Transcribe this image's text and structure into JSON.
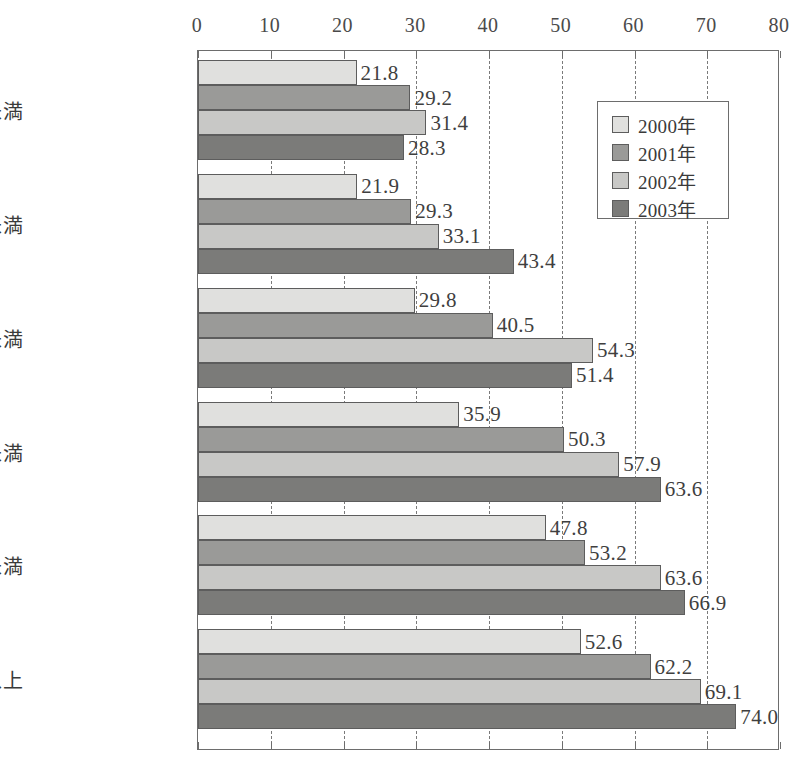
{
  "chart_data": {
    "type": "bar",
    "orientation": "horizontal",
    "title": "",
    "xlabel": "",
    "ylabel": "",
    "xlim": [
      0,
      80
    ],
    "xticks": [
      0,
      10,
      20,
      30,
      40,
      50,
      60,
      70,
      80
    ],
    "grid": true,
    "legend_position": "upper right",
    "categories": [
      "200万未満",
      "200〜400万未満",
      "400〜600万未満",
      "600〜800万未満",
      "800〜1000万未満",
      "1000万以上"
    ],
    "series": [
      {
        "name": "2000年",
        "color": "#e0e0de",
        "values": [
          21.8,
          21.9,
          29.8,
          35.9,
          47.8,
          52.6
        ]
      },
      {
        "name": "2001年",
        "color": "#9a9a98",
        "values": [
          29.2,
          29.3,
          40.5,
          50.3,
          53.2,
          62.2
        ]
      },
      {
        "name": "2002年",
        "color": "#c8c8c6",
        "values": [
          31.4,
          33.1,
          54.3,
          57.9,
          63.6,
          69.1
        ]
      },
      {
        "name": "2003年",
        "color": "#7b7b79",
        "values": [
          28.3,
          43.4,
          51.4,
          63.6,
          66.9,
          74.0
        ]
      }
    ],
    "value_labels": [
      [
        "21.8",
        "29.2",
        "31.4",
        "28.3"
      ],
      [
        "21.9",
        "29.3",
        "33.1",
        "43.4"
      ],
      [
        "29.8",
        "40.5",
        "54.3",
        "51.4"
      ],
      [
        "35.9",
        "50.3",
        "57.9",
        "63.6"
      ],
      [
        "47.8",
        "53.2",
        "63.6",
        "66.9"
      ],
      [
        "52.6",
        "62.2",
        "69.1",
        "74.0"
      ]
    ],
    "xtick_labels": [
      "0",
      "10",
      "20",
      "30",
      "40",
      "50",
      "60",
      "70",
      "80"
    ]
  },
  "legend": {
    "items": [
      {
        "label": "2000年",
        "color": "#e0e0de"
      },
      {
        "label": "2001年",
        "color": "#9a9a98"
      },
      {
        "label": "2002年",
        "color": "#c8c8c6"
      },
      {
        "label": "2003年",
        "color": "#7b7b79"
      }
    ]
  }
}
